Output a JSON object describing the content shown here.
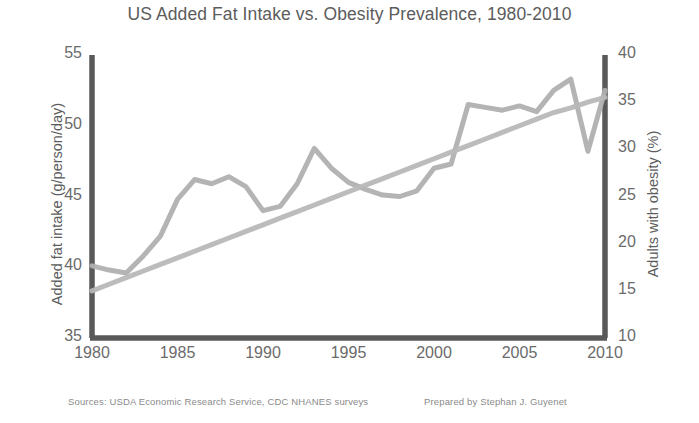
{
  "chart_data": {
    "type": "line",
    "title": "US Added Fat Intake vs. Obesity Prevalence, 1980-2010",
    "xlabel": "",
    "ylabel": "Added fat intake (g/person/day)",
    "y2label": "Adults with obesity (%)",
    "xlim": [
      1980,
      2010
    ],
    "ylim": [
      35,
      55
    ],
    "y2lim": [
      10,
      40
    ],
    "xticks": [
      "1980",
      "1985",
      "1990",
      "1995",
      "2000",
      "2005",
      "2010"
    ],
    "yticks": [
      "35",
      "40",
      "45",
      "50",
      "55"
    ],
    "y2ticks": [
      "10",
      "15",
      "20",
      "25",
      "30",
      "35",
      "40"
    ],
    "grid": false,
    "legend": "none",
    "x": [
      1980,
      1981,
      1982,
      1983,
      1984,
      1985,
      1986,
      1987,
      1988,
      1989,
      1990,
      1991,
      1992,
      1993,
      1994,
      1995,
      1996,
      1997,
      1998,
      1999,
      2000,
      2001,
      2002,
      2003,
      2004,
      2005,
      2006,
      2007,
      2008,
      2009,
      2010
    ],
    "series": [
      {
        "name": "Added fat intake (g/person/day)",
        "axis": "left",
        "color": "#b0b0b0",
        "values": [
          40.1,
          39.8,
          39.6,
          40.8,
          42.2,
          44.8,
          46.2,
          45.9,
          46.4,
          45.7,
          44.0,
          44.3,
          45.9,
          48.4,
          47.0,
          46.0,
          45.5,
          45.1,
          45.0,
          45.4,
          47.0,
          47.3,
          51.5,
          51.3,
          51.1,
          51.4,
          51.0,
          52.5,
          53.3,
          48.2,
          52.5
        ]
      },
      {
        "name": "Adults with obesity (%)",
        "axis": "right",
        "color": "#b8b8b8",
        "values": [
          15.0,
          15.7,
          16.4,
          17.1,
          17.8,
          18.5,
          19.2,
          19.9,
          20.6,
          21.3,
          22.0,
          22.7,
          23.4,
          24.1,
          24.8,
          25.5,
          26.2,
          26.9,
          27.6,
          28.3,
          29.0,
          29.7,
          30.4,
          31.1,
          31.8,
          32.5,
          33.2,
          33.9,
          34.4,
          35.0,
          35.5
        ]
      }
    ],
    "axis_color": "#595959"
  },
  "footer": {
    "sources": "Sources: USDA Economic Research Service, CDC NHANES surveys",
    "credit": "Prepared by Stephan J. Guyenet"
  }
}
